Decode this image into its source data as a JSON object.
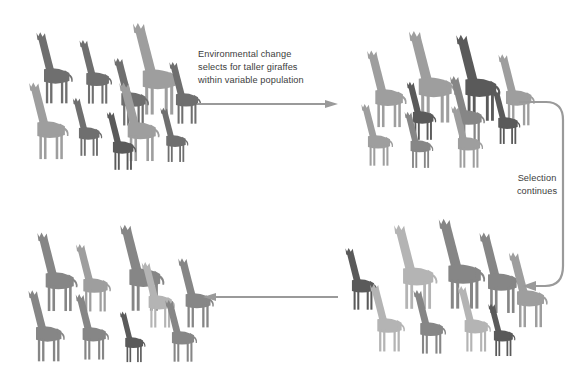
{
  "diagram": {
    "background_color": "#ffffff",
    "arrow_color": "#9a9a9a"
  },
  "labels": {
    "top_arrow_text": "Environmental change\nselects for taller giraffes\nwithin variable population",
    "right_arrow_text": "Selection\ncontinues"
  },
  "palette": {
    "darkest": "#5a5a5a",
    "dark": "#6f6f6f",
    "medium": "#868686",
    "light": "#9e9e9e",
    "lightest": "#b4b4b4"
  },
  "arrows": [
    {
      "name": "arrow-top-right",
      "direction": "right"
    },
    {
      "name": "arrow-right-curved",
      "direction": "down-left"
    },
    {
      "name": "arrow-bottom-left",
      "direction": "left"
    }
  ],
  "populations": [
    {
      "name": "population-1-initial",
      "caption": "Variable starting population",
      "giraffes": [
        {
          "x": 14,
          "y": 12,
          "h": 76,
          "shade": "#6f6f6f"
        },
        {
          "x": 58,
          "y": 20,
          "h": 68,
          "shade": "#6f6f6f"
        },
        {
          "x": 108,
          "y": 2,
          "h": 98,
          "shade": "#9e9e9e"
        },
        {
          "x": 92,
          "y": 38,
          "h": 72,
          "shade": "#6f6f6f"
        },
        {
          "x": 148,
          "y": 42,
          "h": 66,
          "shade": "#6f6f6f"
        },
        {
          "x": 6,
          "y": 62,
          "h": 82,
          "shade": "#9e9e9e"
        },
        {
          "x": 52,
          "y": 78,
          "h": 62,
          "shade": "#6f6f6f"
        },
        {
          "x": 96,
          "y": 62,
          "h": 84,
          "shade": "#9e9e9e"
        },
        {
          "x": 86,
          "y": 92,
          "h": 62,
          "shade": "#5a5a5a"
        },
        {
          "x": 140,
          "y": 88,
          "h": 58,
          "shade": "#6f6f6f"
        }
      ]
    },
    {
      "name": "population-2-after-selection",
      "caption": "Taller giraffes favoured",
      "giraffes": [
        {
          "x": 8,
          "y": 22,
          "h": 82,
          "shade": "#9e9e9e"
        },
        {
          "x": 48,
          "y": 2,
          "h": 98,
          "shade": "#9e9e9e"
        },
        {
          "x": 96,
          "y": 6,
          "h": 92,
          "shade": "#5a5a5a"
        },
        {
          "x": 140,
          "y": 26,
          "h": 76,
          "shade": "#9e9e9e"
        },
        {
          "x": 50,
          "y": 54,
          "h": 62,
          "shade": "#5a5a5a"
        },
        {
          "x": 92,
          "y": 48,
          "h": 72,
          "shade": "#868686"
        },
        {
          "x": 136,
          "y": 62,
          "h": 58,
          "shade": "#5a5a5a"
        },
        {
          "x": 4,
          "y": 76,
          "h": 66,
          "shade": "#9e9e9e"
        },
        {
          "x": 48,
          "y": 84,
          "h": 60,
          "shade": "#868686"
        },
        {
          "x": 94,
          "y": 78,
          "h": 66,
          "shade": "#9e9e9e"
        }
      ]
    },
    {
      "name": "population-3-further-selection",
      "caption": "Selection continues",
      "giraffes": [
        {
          "x": 16,
          "y": 30,
          "h": 66,
          "shade": "#5a5a5a"
        },
        {
          "x": 62,
          "y": 6,
          "h": 90,
          "shade": "#b4b4b4"
        },
        {
          "x": 106,
          "y": 0,
          "h": 96,
          "shade": "#868686"
        },
        {
          "x": 148,
          "y": 14,
          "h": 86,
          "shade": "#868686"
        },
        {
          "x": 178,
          "y": 34,
          "h": 80,
          "shade": "#9e9e9e"
        },
        {
          "x": 40,
          "y": 66,
          "h": 72,
          "shade": "#b4b4b4"
        },
        {
          "x": 84,
          "y": 72,
          "h": 68,
          "shade": "#868686"
        },
        {
          "x": 128,
          "y": 68,
          "h": 70,
          "shade": "#b4b4b4"
        },
        {
          "x": 160,
          "y": 86,
          "h": 56,
          "shade": "#5a5a5a"
        }
      ]
    },
    {
      "name": "population-4-final",
      "caption": "Mostly tall population",
      "giraffes": [
        {
          "x": 18,
          "y": 14,
          "h": 84,
          "shade": "#868686"
        },
        {
          "x": 58,
          "y": 26,
          "h": 72,
          "shade": "#9e9e9e"
        },
        {
          "x": 100,
          "y": 6,
          "h": 92,
          "shade": "#868686"
        },
        {
          "x": 124,
          "y": 44,
          "h": 70,
          "shade": "#b4b4b4"
        },
        {
          "x": 160,
          "y": 40,
          "h": 74,
          "shade": "#868686"
        },
        {
          "x": 10,
          "y": 72,
          "h": 76,
          "shade": "#868686"
        },
        {
          "x": 58,
          "y": 76,
          "h": 70,
          "shade": "#868686"
        },
        {
          "x": 104,
          "y": 94,
          "h": 54,
          "shade": "#5a5a5a"
        },
        {
          "x": 148,
          "y": 82,
          "h": 66,
          "shade": "#868686"
        }
      ]
    }
  ]
}
